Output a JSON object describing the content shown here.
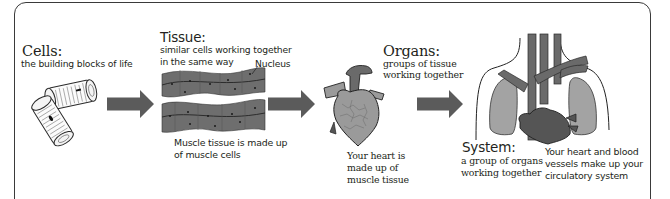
{
  "diagram": {
    "stages": [
      {
        "id": "cells",
        "heading": "Cells:",
        "description": "the building blocks of life",
        "illustration": "muscle-cells-icon"
      },
      {
        "id": "tissue",
        "heading": "Tissue:",
        "description_lines": [
          "similar cells working together",
          "in the same way"
        ],
        "callout": "Nucleus",
        "note_lines": [
          "Muscle tissue is made up",
          "of muscle cells"
        ],
        "illustration": "muscle-tissue-icon"
      },
      {
        "id": "organs",
        "heading": "Organs:",
        "description_lines": [
          "groups of tissue",
          "working together"
        ],
        "note_lines": [
          "Your heart is",
          "made up of",
          "muscle tissue"
        ],
        "illustration": "heart-icon"
      },
      {
        "id": "system",
        "heading": "System:",
        "description_lines": [
          "a group of organs",
          "working together"
        ],
        "note_lines": [
          "Your heart and blood",
          "vessels make up your",
          "circulatory system"
        ],
        "illustration": "circulatory-system-icon"
      }
    ],
    "arrows": [
      "arrow-right-icon",
      "arrow-right-icon",
      "arrow-right-icon"
    ],
    "colors": {
      "frame": "#3a3a3a",
      "arrow": "#5b5b5b",
      "tissue": "#6e6e6e",
      "heart": "#9a9a9a",
      "vessels": "#6a6a6a",
      "lungs": "#a3a3a3",
      "text": "#231f20"
    }
  }
}
